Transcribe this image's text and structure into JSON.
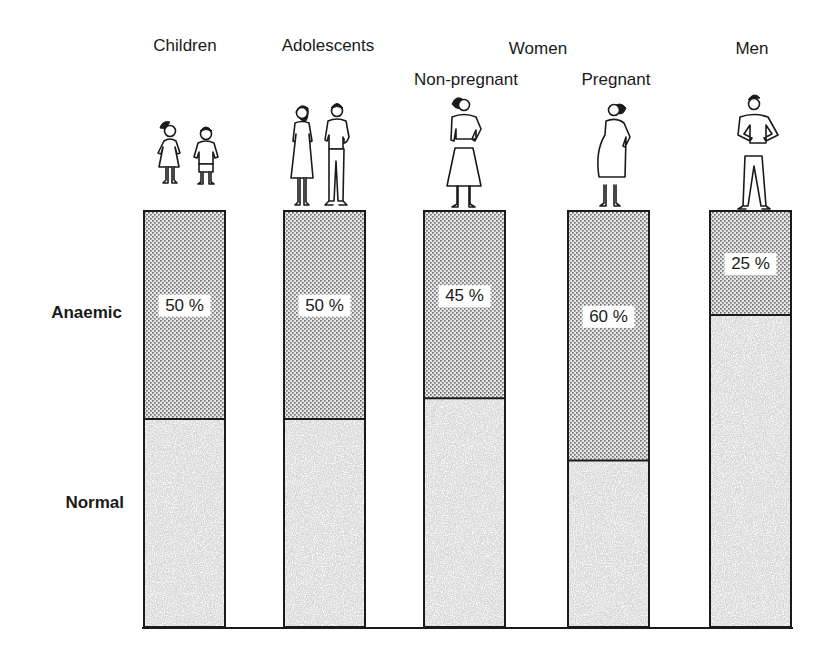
{
  "chart_data": {
    "type": "bar",
    "stacked": true,
    "title": "",
    "xlabel": "",
    "ylabel": "",
    "ylim": [
      0,
      100
    ],
    "grid": false,
    "group_labels": [
      {
        "label": "Women",
        "spans": [
          "Non-pregnant",
          "Pregnant"
        ]
      }
    ],
    "categories": [
      "Children",
      "Adolescents",
      "Non-pregnant",
      "Pregnant",
      "Men"
    ],
    "row_labels": {
      "anaemic": "Anaemic",
      "normal": "Normal"
    },
    "series": [
      {
        "name": "Normal",
        "values": [
          50,
          50,
          55,
          40,
          75
        ],
        "color": "#555555",
        "pattern": "dense-stipple"
      },
      {
        "name": "Anaemic",
        "values": [
          50,
          50,
          45,
          60,
          25
        ],
        "color": "#cfcfcf",
        "pattern": "light-dots"
      }
    ],
    "data_labels": [
      "50 %",
      "50 %",
      "45 %",
      "60 %",
      "25 %"
    ],
    "pictograms": [
      "girl-and-boy-icon",
      "teen-girl-and-boy-icon",
      "woman-icon",
      "pregnant-woman-icon",
      "man-icon"
    ],
    "legend": "none"
  }
}
